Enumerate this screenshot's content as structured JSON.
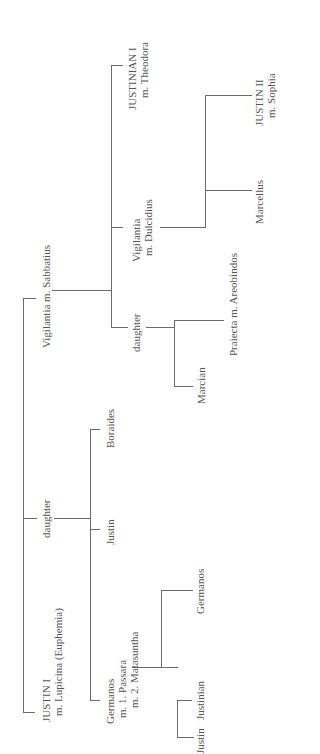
{
  "diagram": {
    "orientation": "rotated 90 degrees counter-clockwise",
    "nodes": {
      "justin1": {
        "line1": "JUSTIN I",
        "line2": "m. Lupicina (Euphemia)"
      },
      "daughter1": {
        "line1": "daughter"
      },
      "germanos": {
        "line1": "Germanos",
        "line2": "m. 1. Passara",
        "line3": "m. 2. Matasuntha"
      },
      "justin_son": {
        "line1": "Justin"
      },
      "boraides": {
        "line1": "Boraides"
      },
      "justin_g": {
        "line1": "Justin"
      },
      "justinian_g": {
        "line1": "Justinian"
      },
      "germanos_jr": {
        "line1": "Germanos"
      },
      "vigilantia1": {
        "line1": "Vigilantia m. Sabbatius"
      },
      "daughter2": {
        "line1": "daughter"
      },
      "marcian": {
        "line1": "Marcian"
      },
      "praiecta": {
        "line1": "Praiecta m. Areobindos"
      },
      "vigilantia2": {
        "line1": "Vigilantia",
        "line2": "m. Dulcidius"
      },
      "marcellus": {
        "line1": "Marcellus"
      },
      "justin2": {
        "line1": "JUSTIN II",
        "line2": "m. Sophia"
      },
      "justinian1": {
        "line1": "JUSTINIAN I",
        "line2": "m. Theodora"
      }
    },
    "edges": [
      [
        "justin1",
        "daughter1"
      ],
      [
        "justin1",
        "vigilantia1"
      ],
      [
        "daughter1",
        "germanos"
      ],
      [
        "daughter1",
        "justin_son"
      ],
      [
        "daughter1",
        "boraides"
      ],
      [
        "germanos",
        "justin_g"
      ],
      [
        "germanos",
        "justinian_g"
      ],
      [
        "germanos",
        "germanos_jr"
      ],
      [
        "vigilantia1",
        "daughter2"
      ],
      [
        "vigilantia1",
        "vigilantia2"
      ],
      [
        "vigilantia1",
        "justinian1"
      ],
      [
        "daughter2",
        "marcian"
      ],
      [
        "daughter2",
        "praiecta"
      ],
      [
        "vigilantia2",
        "marcellus"
      ],
      [
        "vigilantia2",
        "justin2"
      ]
    ],
    "line_color": "#6b6b6b",
    "text_color": "#555555"
  }
}
